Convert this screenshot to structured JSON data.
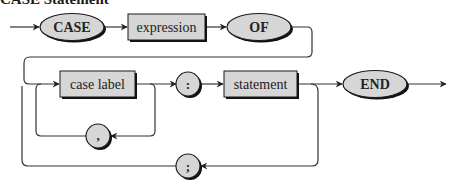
{
  "title": "CASE Statement",
  "colors": {
    "node_fill": "#d6d6d6",
    "node_stroke": "#1a1a1a",
    "shadow": "#111111",
    "line": "#333333",
    "background": "#ffffff"
  },
  "nodes": {
    "case_keyword": {
      "label": "CASE",
      "shape": "ellipse",
      "kind": "terminal"
    },
    "expression": {
      "label": "expression",
      "shape": "rectangle",
      "kind": "nonterminal"
    },
    "of_keyword": {
      "label": "OF",
      "shape": "ellipse",
      "kind": "terminal"
    },
    "case_label": {
      "label": "case label",
      "shape": "rectangle",
      "kind": "nonterminal"
    },
    "colon": {
      "label": ":",
      "shape": "circle",
      "kind": "terminal"
    },
    "statement": {
      "label": "statement",
      "shape": "rectangle",
      "kind": "nonterminal"
    },
    "end_keyword": {
      "label": "END",
      "shape": "ellipse",
      "kind": "terminal"
    },
    "comma": {
      "label": ",",
      "shape": "circle",
      "kind": "terminal"
    },
    "semicolon": {
      "label": ";",
      "shape": "circle",
      "kind": "terminal"
    }
  },
  "edges": [
    {
      "from": "start",
      "to": "case_keyword"
    },
    {
      "from": "case_keyword",
      "to": "expression"
    },
    {
      "from": "expression",
      "to": "of_keyword"
    },
    {
      "from": "of_keyword",
      "to": "case_label"
    },
    {
      "from": "case_label",
      "to": "colon"
    },
    {
      "from": "case_label",
      "to": "comma",
      "note": "loop back"
    },
    {
      "from": "comma",
      "to": "case_label"
    },
    {
      "from": "colon",
      "to": "statement"
    },
    {
      "from": "statement",
      "to": "end_keyword"
    },
    {
      "from": "statement",
      "to": "semicolon",
      "note": "loop back"
    },
    {
      "from": "semicolon",
      "to": "case_label"
    },
    {
      "from": "end_keyword",
      "to": "exit"
    }
  ]
}
